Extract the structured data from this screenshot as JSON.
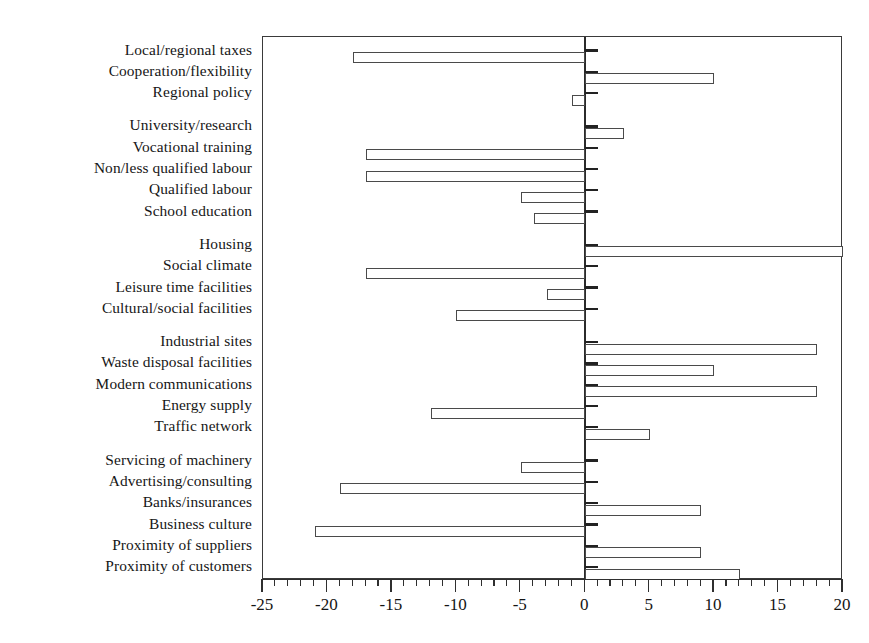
{
  "chart_data": {
    "type": "bar",
    "orientation": "horizontal",
    "title": "",
    "subtitle": "",
    "xlabel": "",
    "ylabel": "",
    "xlim": [
      -25,
      20
    ],
    "ylim": null,
    "grid": false,
    "legend": null,
    "legend_position": "none",
    "x_major_ticks": [
      -25,
      -20,
      -15,
      -10,
      -5,
      0,
      5,
      10,
      15,
      20
    ],
    "x_major_tick_labels": [
      "-25",
      "-20",
      "-15",
      "-10",
      "-5",
      "0",
      "5",
      "10",
      "15",
      "20"
    ],
    "x_minor_tick_step": 1,
    "bar_color": "#ffffff",
    "bar_edge_color": "#4a4a4a",
    "axis_color": "#2f2f2f",
    "groups": [
      {
        "name": "policy",
        "categories": [
          "Local/regional taxes",
          "Cooperation/flexibility",
          "Regional policy"
        ],
        "values": [
          -18,
          10,
          -1
        ]
      },
      {
        "name": "education",
        "categories": [
          "University/research",
          "Vocational training",
          "Non/less qualified labour",
          "Qualified labour",
          "School education"
        ],
        "values": [
          3,
          -17,
          -17,
          -5,
          -4
        ]
      },
      {
        "name": "living",
        "categories": [
          "Housing",
          "Social climate",
          "Leisure time facilities",
          "Cultural/social facilities"
        ],
        "values": [
          20,
          -17,
          -3,
          -10
        ]
      },
      {
        "name": "infrastructure",
        "categories": [
          "Industrial sites",
          "Waste disposal facilities",
          "Modern communications",
          "Energy supply",
          "Traffic network"
        ],
        "values": [
          18,
          10,
          18,
          -12,
          5
        ]
      },
      {
        "name": "business",
        "categories": [
          "Servicing of machinery",
          "Advertising/consulting",
          "Banks/insurances",
          "Business culture",
          "Proximity of suppliers",
          "Proximity of customers"
        ],
        "values": [
          -5,
          -19,
          9,
          -21,
          9,
          12
        ]
      }
    ],
    "categories": [
      "Local/regional taxes",
      "Cooperation/flexibility",
      "Regional policy",
      "University/research",
      "Vocational training",
      "Non/less qualified labour",
      "Qualified labour",
      "School education",
      "Housing",
      "Social climate",
      "Leisure time facilities",
      "Cultural/social facilities",
      "Industrial sites",
      "Waste disposal facilities",
      "Modern communications",
      "Energy supply",
      "Traffic network",
      "Servicing of machinery",
      "Advertising/consulting",
      "Banks/insurances",
      "Business culture",
      "Proximity of suppliers",
      "Proximity of customers"
    ],
    "values": [
      -18,
      10,
      -1,
      3,
      -17,
      -17,
      -5,
      -4,
      20,
      -17,
      -3,
      -10,
      18,
      10,
      18,
      -12,
      5,
      -5,
      -19,
      9,
      -21,
      9,
      12
    ]
  }
}
